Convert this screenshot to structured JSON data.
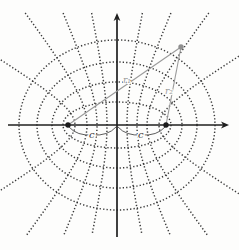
{
  "figure": {
    "background_color": "#fdfdfc",
    "curve_color": "#2b2b2b",
    "axis_color": "#1f1f1f",
    "gray_accent_color": "#9a9a9a",
    "label_color": "#3a3a3a",
    "canvas": {
      "width": 239,
      "height": 250
    },
    "origin": {
      "x": 117,
      "y": 125
    },
    "axes": {
      "x": {
        "from": 8,
        "to": 224,
        "arrow_tip": 229
      },
      "y": {
        "from": 237,
        "to": 19,
        "arrow_tip": 13
      }
    },
    "focal_half_distance_px": 49,
    "foci": {
      "left": {
        "x": 68,
        "y": 125
      },
      "right": {
        "x": 166,
        "y": 125
      },
      "dot_radius": 2.7
    },
    "ellipses": [
      {
        "a": 54,
        "b": 23
      },
      {
        "a": 65,
        "b": 43
      },
      {
        "a": 80,
        "b": 63
      },
      {
        "a": 98,
        "b": 85
      }
    ],
    "hyperbola_vertices": [
      10,
      20,
      30,
      42
    ],
    "point": {
      "x": 181,
      "y": 47,
      "radius": 2.7
    },
    "labels": {
      "r1": "r₁",
      "r2": "r₂",
      "c_left": "c",
      "c_right": "c"
    },
    "label_positions": {
      "r1": {
        "x": 123,
        "y": 83
      },
      "r2": {
        "x": 165,
        "y": 94
      },
      "c_left": {
        "x": 89,
        "y": 138
      },
      "c_right": {
        "x": 138,
        "y": 138
      }
    }
  }
}
